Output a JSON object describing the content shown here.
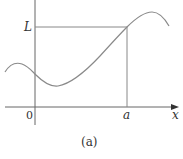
{
  "figure": {
    "caption": "(a)",
    "labels": {
      "y_tick": "L",
      "origin": "0",
      "x_tick": "a",
      "x_axis": "x"
    },
    "colors": {
      "axes": "#555555",
      "guide_lines": "#888888",
      "curve": "#888888",
      "text": "#333333"
    },
    "geometry": {
      "y_axis_x": 35,
      "x_axis_y": 107,
      "L_level_y": 27,
      "a_position_x": 127
    }
  }
}
